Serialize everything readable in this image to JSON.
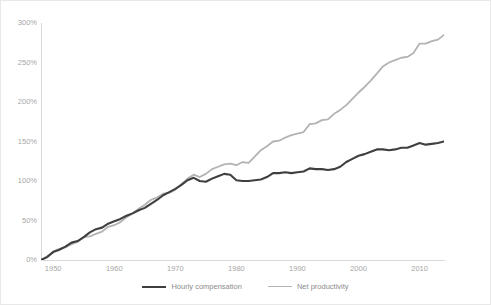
{
  "chart_data": {
    "type": "line",
    "title": "",
    "xlabel": "",
    "ylabel": "",
    "xlim": [
      1948,
      2014
    ],
    "ylim": [
      0,
      300
    ],
    "grid": false,
    "legend_position": "bottom",
    "y_tick_labels": [
      "300%",
      "250%",
      "200%",
      "150%",
      "100%",
      "50%",
      "0%"
    ],
    "y_tick_values": [
      300,
      250,
      200,
      150,
      100,
      50,
      0
    ],
    "x_tick_labels": [
      "1950",
      "1960",
      "1970",
      "1980",
      "1990",
      "2000",
      "2010"
    ],
    "x_tick_values": [
      1950,
      1960,
      1970,
      1980,
      1990,
      2000,
      2010
    ],
    "x": [
      1948,
      1949,
      1950,
      1951,
      1952,
      1953,
      1954,
      1955,
      1956,
      1957,
      1958,
      1959,
      1960,
      1961,
      1962,
      1963,
      1964,
      1965,
      1966,
      1967,
      1968,
      1969,
      1970,
      1971,
      1972,
      1973,
      1974,
      1975,
      1976,
      1977,
      1978,
      1979,
      1980,
      1981,
      1982,
      1983,
      1984,
      1985,
      1986,
      1987,
      1988,
      1989,
      1990,
      1991,
      1992,
      1993,
      1994,
      1995,
      1996,
      1997,
      1998,
      1999,
      2000,
      2001,
      2002,
      2003,
      2004,
      2005,
      2006,
      2007,
      2008,
      2009,
      2010,
      2011,
      2012,
      2013,
      2014
    ],
    "series": [
      {
        "name": "Hourly compensation",
        "color": "#3f3f3f",
        "linewidth": 2.1,
        "values": [
          0,
          4,
          10,
          13,
          17,
          22,
          24,
          29,
          35,
          39,
          41,
          46,
          49,
          52,
          56,
          59,
          63,
          66,
          71,
          76,
          82,
          86,
          90,
          95,
          101,
          104,
          100,
          99,
          103,
          106,
          109,
          108,
          101,
          100,
          100,
          101,
          102,
          105,
          110,
          110,
          111,
          110,
          111,
          112,
          116,
          115,
          115,
          114,
          115,
          118,
          124,
          128,
          132,
          134,
          137,
          140,
          140,
          139,
          140,
          142,
          142,
          145,
          148,
          146,
          147,
          148,
          150
        ],
        "values_note": "indexed percent growth since 1948"
      },
      {
        "name": "Net productivity",
        "color": "#b3b3b3",
        "linewidth": 1.8,
        "values": [
          0,
          3,
          11,
          14,
          16,
          20,
          23,
          29,
          30,
          33,
          36,
          42,
          44,
          48,
          54,
          59,
          65,
          70,
          76,
          79,
          84,
          85,
          89,
          96,
          103,
          108,
          105,
          109,
          115,
          118,
          121,
          122,
          120,
          124,
          123,
          131,
          139,
          144,
          150,
          151,
          155,
          158,
          160,
          162,
          172,
          173,
          177,
          178,
          185,
          190,
          196,
          204,
          212,
          219,
          227,
          236,
          245,
          250,
          253,
          256,
          257,
          262,
          274,
          274,
          277,
          279,
          285
        ],
        "values_note": "indexed percent growth since 1948"
      }
    ]
  },
  "legend": {
    "items": [
      {
        "label": "Hourly compensation",
        "color": "#3f3f3f",
        "width": "2.2px"
      },
      {
        "label": "Net productivity",
        "color": "#b3b3b3",
        "width": "1.8px"
      }
    ]
  },
  "style": {
    "axis_color": "#d9d9d9",
    "tick_text_color": "#a6a6a6",
    "legend_text_color": "#8c8c8c",
    "plot_background": "#ffffff",
    "card_border": "#e8e8e8"
  }
}
